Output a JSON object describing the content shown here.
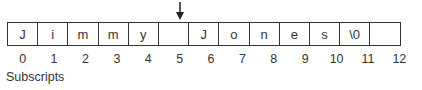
{
  "diagram": {
    "pointer_index": 5,
    "cells": [
      "J",
      "i",
      "m",
      "m",
      "y",
      "",
      "J",
      "o",
      "n",
      "e",
      "s",
      "\\0",
      ""
    ],
    "subscripts": [
      "0",
      "1",
      "2",
      "3",
      "4",
      "5",
      "6",
      "7",
      "8",
      "9",
      "10",
      "11",
      "12"
    ],
    "label": "Subscripts",
    "colors": {
      "line": "#333333",
      "text": "#333333",
      "background": "#ffffff"
    }
  }
}
